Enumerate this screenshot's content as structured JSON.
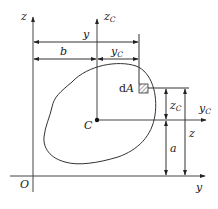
{
  "diagram": {
    "title": "",
    "type": "centroid-parallel-axis-figure",
    "colors": {
      "line": "#333333",
      "background": "#ffffff",
      "hatch": "#555555"
    },
    "labels": {
      "origin": "O",
      "z_axis": "z",
      "y_axis": "y",
      "zc_axis_main": "z",
      "zc_axis_sub": "C",
      "yc_axis_main": "y",
      "yc_axis_sub": "C",
      "centroid": "C",
      "area_element_prefix": "d",
      "area_element_var": "A",
      "dim_y": "y",
      "dim_b": "b",
      "dim_yc_main": "y",
      "dim_yc_sub": "C",
      "dim_zc_main": "z",
      "dim_zc_sub": "C",
      "dim_z": "z",
      "dim_a": "a"
    },
    "nodes": [
      {
        "id": "O",
        "label": "O",
        "role": "origin"
      },
      {
        "id": "C",
        "label": "C",
        "role": "centroid"
      },
      {
        "id": "dA",
        "label": "dA",
        "role": "area-element"
      }
    ],
    "axes": [
      {
        "id": "z",
        "label": "z",
        "direction": "up",
        "through": "O"
      },
      {
        "id": "y",
        "label": "y",
        "direction": "right",
        "through": "O"
      },
      {
        "id": "zC",
        "label": "z_C",
        "direction": "up",
        "through": "C"
      },
      {
        "id": "yC",
        "label": "y_C",
        "direction": "right",
        "through": "C"
      }
    ],
    "dimensions": [
      {
        "label": "y",
        "from": "z axis",
        "to": "dA",
        "orientation": "horizontal"
      },
      {
        "label": "b",
        "from": "z axis",
        "to": "zC axis",
        "orientation": "horizontal"
      },
      {
        "label": "y_C",
        "from": "zC axis",
        "to": "dA",
        "orientation": "horizontal"
      },
      {
        "label": "z_C",
        "from": "yC axis",
        "to": "dA",
        "orientation": "vertical"
      },
      {
        "label": "a",
        "from": "y axis",
        "to": "yC axis",
        "orientation": "vertical"
      },
      {
        "label": "z",
        "from": "y axis",
        "to": "dA",
        "orientation": "vertical"
      }
    ]
  }
}
